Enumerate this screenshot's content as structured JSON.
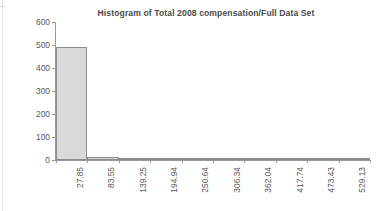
{
  "chart_data": {
    "type": "bar",
    "title": "Histogram of Total 2008 compensation/Full Data Set",
    "xlabel": "",
    "ylabel": "Frequency",
    "categories": [
      "27.85",
      "83.55",
      "139.25",
      "194.94",
      "250.64",
      "306.34",
      "362.04",
      "417.74",
      "473.43",
      "529.13"
    ],
    "values": [
      493,
      13,
      8,
      7,
      2,
      1,
      1,
      1,
      6,
      1
    ],
    "ylim": [
      0,
      600
    ],
    "yticks": [
      0,
      100,
      200,
      300,
      400,
      500,
      600
    ],
    "ytick_labels": [
      "0",
      "100",
      "200",
      "300",
      "400",
      "500",
      "600"
    ],
    "grid": false,
    "legend": false,
    "bar_color": "#d9d9d9",
    "bar_border_color": "#8c8c8c",
    "axis_color": "#9a9a9a",
    "title_color": "#4a4a4a",
    "label_color": "#595959"
  }
}
